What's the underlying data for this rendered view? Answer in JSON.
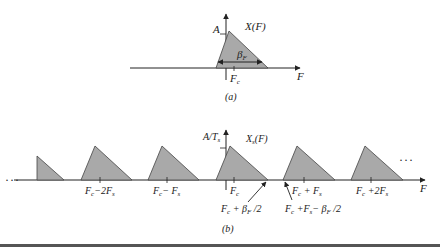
{
  "diagram": {
    "panel_a": {
      "caption": "(a)",
      "spectrum_label": "X(F)",
      "amplitude_label": "A",
      "bandwidth_label": "β",
      "bandwidth_sub": "F",
      "axis_label": "F",
      "center_label": "F",
      "center_sub": "c"
    },
    "panel_b": {
      "caption": "(b)",
      "spectrum_label": "X",
      "spectrum_sub": "s",
      "spectrum_arg": "(F)",
      "amplitude_label": "A/T",
      "amplitude_sub": "s",
      "axis_label": "F",
      "ellipsis_left": "···",
      "ellipsis_right": "···",
      "ticks": [
        {
          "label": "F",
          "sub": "c",
          "rest": "−2F",
          "rest_sub": "s"
        },
        {
          "label": "F",
          "sub": "c",
          "rest": "− F",
          "rest_sub": "s"
        },
        {
          "label": "F",
          "sub": "c",
          "rest": "",
          "rest_sub": ""
        },
        {
          "label": "F",
          "sub": "c",
          "rest": " + F",
          "rest_sub": "s"
        },
        {
          "label": "F",
          "sub": "c",
          "rest": " +2F",
          "rest_sub": "s"
        }
      ],
      "annotation_upper_edge": {
        "a": "F",
        "a_sub": "c",
        "b": " + β",
        "b_sub": "F",
        "c": " /2"
      },
      "annotation_lower_edge": {
        "a": "F",
        "a_sub": "c",
        "b": " +F",
        "b_sub": "s",
        "c": "− β",
        "c_sub": "F",
        "d": " /2"
      }
    },
    "colors": {
      "fill": "#a9a9a9",
      "stroke": "#222222",
      "border": "#555555"
    }
  }
}
